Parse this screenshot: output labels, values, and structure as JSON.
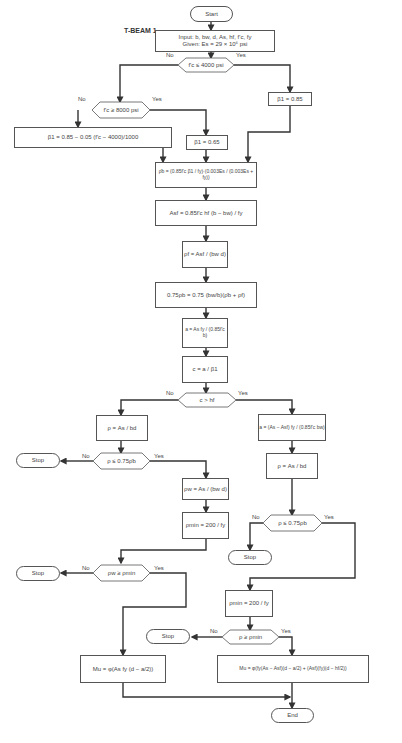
{
  "title": "T-BEAM 1",
  "labels": {
    "yes": "Yes",
    "no": "No"
  },
  "nodes": {
    "start": "Start",
    "input_line1": "Input: b, bw, d, As, hf, f'c, fy",
    "input_line2": "Given: Es = 29 × 10⁶ psi",
    "dec_fc_4000": "f'c ≤ 4000 psi",
    "beta1_085": "β1 = 0.85",
    "dec_fc_8000": "f'c ≥ 8000 psi",
    "beta1_formula": "β1 = 0.85 − 0.05 (f'c − 4000)/1000",
    "beta1_065": "β1 = 0.65",
    "rho_b": "ρ̄b = (0.85f'c β1 / fy)·(0.003Es / (0.003Es + fy))",
    "asf": "Asf = 0.85f'c hf (b − bw) / fy",
    "rho_f": "ρf = Asf / (bw d)",
    "rho_075": "0.75ρb = 0.75 (bw/b)(ρ̄b + ρf)",
    "a": "a = As fy / (0.85f'c b)",
    "c": "c = a / β1",
    "dec_c_hf": "c > hf",
    "rho_left": "ρ = As / bd",
    "dec_rho_075_left": "ρ ≤ 0.75ρ̄b",
    "stop1": "Stop",
    "rho_w": "ρw = As / (bw d)",
    "rho_min_left": "ρmin = 200 / fy",
    "dec_rhow_min": "ρw ≥ ρmin",
    "stop2": "Stop",
    "mu_left": "Mu = φ(As fy (d − a/2))",
    "a_right": "a = (As − Asf) fy / (0.85f'c bw)",
    "rho_right": "ρ = As / bd",
    "dec_rho_075_right": "ρ ≤ 0.75ρb",
    "stop3": "Stop",
    "rho_min_right": "ρmin = 200 / fy",
    "dec_rho_min": "ρ ≥ ρmin",
    "stop4": "Stop",
    "mu_right": "Mu = φ(fy(As − Asf)(d − a/2) + (Asf)(fy)(d − hf/2))",
    "end": "End"
  },
  "colors": {
    "line": "#333333",
    "border": "#555555",
    "background": "#ffffff"
  }
}
